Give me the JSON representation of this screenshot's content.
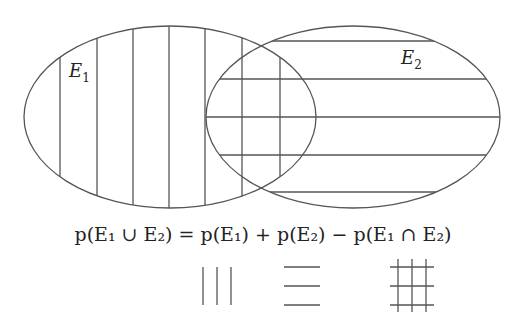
{
  "diagram": {
    "type": "venn",
    "stroke_color": "#555555",
    "sets": [
      {
        "id": "E1",
        "label": "E",
        "subscript": "1",
        "hatch": "vertical"
      },
      {
        "id": "E2",
        "label": "E",
        "subscript": "2",
        "hatch": "horizontal"
      }
    ],
    "formula": {
      "lhs": "p(E₁ ∪ E₂)",
      "equals": "=",
      "terms": [
        "p(E₁)",
        "+",
        "p(E₂)",
        "−",
        "p(E₁ ∩ E₂)"
      ]
    },
    "legend": [
      {
        "pattern": "vertical-lines",
        "meaning": "E1"
      },
      {
        "pattern": "horizontal-lines",
        "meaning": "E2"
      },
      {
        "pattern": "grid",
        "meaning": "E1 ∩ E2"
      }
    ]
  }
}
